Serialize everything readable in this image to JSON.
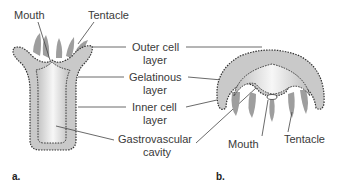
{
  "diagram": {
    "panel_a": {
      "label": "a.",
      "organism": "polyp",
      "labels": {
        "mouth": "Mouth",
        "tentacle": "Tentacle",
        "outer_cell_layer_1": "Outer cell",
        "outer_cell_layer_2": "layer",
        "gelatinous_layer_1": "Gelatinous",
        "gelatinous_layer_2": "layer",
        "inner_cell_layer_1": "Inner cell",
        "inner_cell_layer_2": "layer",
        "gastrovascular_1": "Gastrovascular",
        "gastrovascular_2": "cavity"
      }
    },
    "panel_b": {
      "label": "b.",
      "organism": "medusa",
      "labels": {
        "mouth": "Mouth",
        "tentacle": "Tentacle"
      }
    },
    "colors": {
      "body_fill": "#c9c9c9",
      "cavity_fill": "#f4f4f4",
      "tentacle_fill": "#9e9e9e",
      "outline": "#333333",
      "leader": "#444444"
    }
  }
}
